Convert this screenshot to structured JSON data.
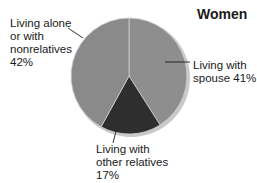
{
  "chart_data": {
    "type": "pie",
    "title": "Women",
    "start_angle_deg": 0,
    "direction": "clockwise",
    "slices": [
      {
        "label": "Living with spouse",
        "value": 41,
        "value_label": "41%",
        "color": "#8e8e8e"
      },
      {
        "label": "Living with other relatives",
        "value": 17,
        "value_label": "17%",
        "color": "#2e2e2e"
      },
      {
        "label": "Living alone or with nonrelatives",
        "value": 42,
        "value_label": "42%",
        "color": "#8a8a8a"
      }
    ],
    "annotations": {
      "spouse": "Living with\nspouse 41%",
      "other": "Living with\nother relatives\n17%",
      "alone": "Living alone\nor with\nnonrelatives\n42%"
    }
  }
}
